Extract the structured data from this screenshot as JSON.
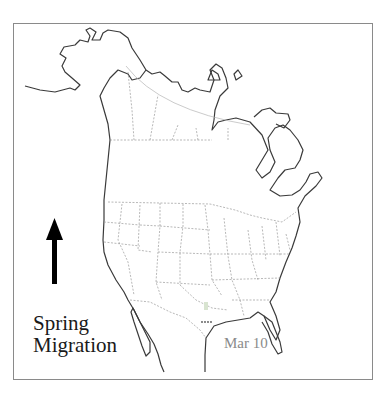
{
  "map": {
    "title": "Spring Migration",
    "title_lines": [
      "Spring",
      "Migration"
    ],
    "date_label": "Mar 10",
    "direction_icon": "up-arrow-icon",
    "region": "North America",
    "observation_marker": {
      "location": "South Texas",
      "color": "#c8d8c0"
    },
    "colors": {
      "coastline": "#3a3a3a",
      "borders": "#9a9a9a",
      "frame": "#8a8a8a",
      "date_text": "#8a8a8a",
      "title_text": "#1a1a1a"
    }
  }
}
